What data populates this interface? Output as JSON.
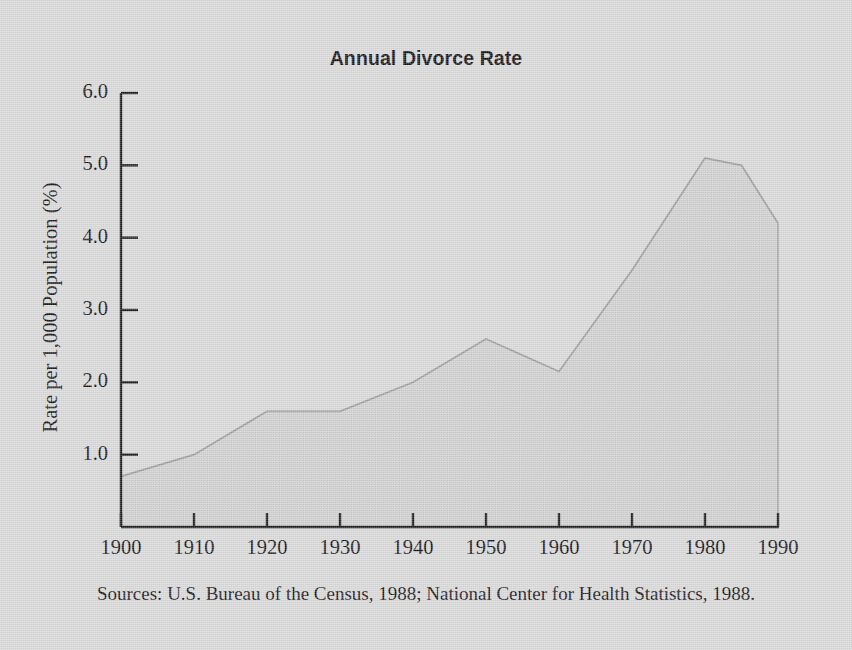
{
  "figure": {
    "title": "Annual Divorce Rate",
    "source_note": "Sources: U.S. Bureau of the Census, 1988; National Center for Health Statistics, 1988.",
    "background_color": "#d9d9d9",
    "axis_color": "#1c1c1c",
    "area_fill_color": "#cfcfcf",
    "line_color": "#9a9a9a"
  },
  "chart_data": {
    "type": "area",
    "title": "Annual Divorce Rate",
    "xlabel": "",
    "ylabel": "Rate per 1,000 Population (%)",
    "x": [
      1900,
      1910,
      1920,
      1930,
      1940,
      1950,
      1960,
      1970,
      1980,
      1985,
      1990
    ],
    "values": [
      0.7,
      1.0,
      1.6,
      1.6,
      2.0,
      2.6,
      2.15,
      3.55,
      5.1,
      5.0,
      4.2
    ],
    "series": [
      {
        "name": "Annual Divorce Rate",
        "values": [
          0.7,
          1.0,
          1.6,
          1.6,
          2.0,
          2.6,
          2.15,
          3.55,
          5.1,
          5.0,
          4.2
        ]
      }
    ],
    "xlim": [
      1900,
      1990
    ],
    "ylim": [
      0.0,
      6.0
    ],
    "xticks": [
      1900,
      1910,
      1920,
      1930,
      1940,
      1950,
      1960,
      1970,
      1980,
      1990
    ],
    "xtick_labels": [
      "1900",
      "1910",
      "1920",
      "1930",
      "1940",
      "1950",
      "1960",
      "1970",
      "1980",
      "1990"
    ],
    "yticks": [
      1.0,
      2.0,
      3.0,
      4.0,
      5.0,
      6.0
    ],
    "ytick_labels": [
      "1.0",
      "2.0",
      "3.0",
      "4.0",
      "5.0",
      "6.0"
    ],
    "grid": false,
    "legend": false,
    "legend_position": "none",
    "annotations": [],
    "source": "Sources: U.S. Bureau of the Census, 1988; National Center for Health Statistics, 1988."
  }
}
